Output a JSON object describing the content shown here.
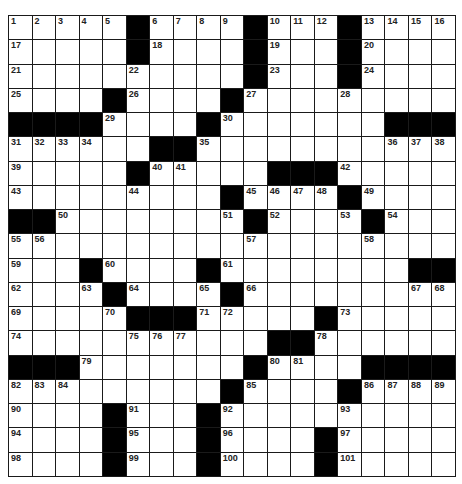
{
  "puzzle": {
    "rows": 19,
    "cols": 19,
    "colors": {
      "block": "#000000",
      "cell": "#ffffff",
      "line": "#1a1a1a",
      "number": "#222222"
    },
    "grid": [
      "WWWWWBWWWWBWWWBWWWW",
      "WWWWWBWWWWBWWWBWWWW",
      "WWWWWWWWWWBWWWBWWWW",
      "WWWWBWWWWBWWWWWWWWW",
      "BBBBWWWWBWWWWWWWBBB",
      "WWWWWWBBWWWWWWWWWWW",
      "WWWWWBWWWWWBBBWWWWW",
      "WWWWWWWWWBWWWWBWWWW",
      "BBWWWWWWWWBWWWWBWWW",
      "WWWWWWWWWWWWWWWWWWW",
      "WWWBWWWWBWWWWWWWWBB",
      "WWWWBWWWWBWWWWWWWWW",
      "WWWWWBBBWWWWWBWWWWW",
      "WWWWWWWWWWWBBWWWWWW",
      "BBBWWWWWWWBWWWWBBBB",
      "WWWWWWWWWBWWWWBWWWW",
      "WWWWBWWWBWWWWWWWWWW",
      "WWWWBWWWBWWWWBWWWWW",
      "WWWWBWWWBWWWWBWWWWW"
    ],
    "numbers": [
      {
        "r": 0,
        "c": 0,
        "n": "1"
      },
      {
        "r": 0,
        "c": 1,
        "n": "2"
      },
      {
        "r": 0,
        "c": 2,
        "n": "3"
      },
      {
        "r": 0,
        "c": 3,
        "n": "4"
      },
      {
        "r": 0,
        "c": 4,
        "n": "5"
      },
      {
        "r": 0,
        "c": 6,
        "n": "6"
      },
      {
        "r": 0,
        "c": 7,
        "n": "7"
      },
      {
        "r": 0,
        "c": 8,
        "n": "8"
      },
      {
        "r": 0,
        "c": 9,
        "n": "9"
      },
      {
        "r": 0,
        "c": 11,
        "n": "10"
      },
      {
        "r": 0,
        "c": 12,
        "n": "11"
      },
      {
        "r": 0,
        "c": 13,
        "n": "12"
      },
      {
        "r": 0,
        "c": 15,
        "n": "13"
      },
      {
        "r": 0,
        "c": 16,
        "n": "14"
      },
      {
        "r": 0,
        "c": 17,
        "n": "15"
      },
      {
        "r": 0,
        "c": 18,
        "n": "16"
      },
      {
        "r": 1,
        "c": 0,
        "n": "17"
      },
      {
        "r": 1,
        "c": 6,
        "n": "18"
      },
      {
        "r": 1,
        "c": 11,
        "n": "19"
      },
      {
        "r": 1,
        "c": 15,
        "n": "20"
      },
      {
        "r": 2,
        "c": 0,
        "n": "21"
      },
      {
        "r": 2,
        "c": 5,
        "n": "22"
      },
      {
        "r": 2,
        "c": 11,
        "n": "23"
      },
      {
        "r": 2,
        "c": 15,
        "n": "24"
      },
      {
        "r": 3,
        "c": 0,
        "n": "25"
      },
      {
        "r": 3,
        "c": 5,
        "n": "26"
      },
      {
        "r": 3,
        "c": 10,
        "n": "27"
      },
      {
        "r": 3,
        "c": 14,
        "n": "28"
      },
      {
        "r": 4,
        "c": 4,
        "n": "29"
      },
      {
        "r": 4,
        "c": 9,
        "n": "30"
      },
      {
        "r": 5,
        "c": 0,
        "n": "31"
      },
      {
        "r": 5,
        "c": 1,
        "n": "32"
      },
      {
        "r": 5,
        "c": 2,
        "n": "33"
      },
      {
        "r": 5,
        "c": 3,
        "n": "34"
      },
      {
        "r": 5,
        "c": 8,
        "n": "35"
      },
      {
        "r": 5,
        "c": 16,
        "n": "36"
      },
      {
        "r": 5,
        "c": 17,
        "n": "37"
      },
      {
        "r": 5,
        "c": 18,
        "n": "38"
      },
      {
        "r": 6,
        "c": 0,
        "n": "39"
      },
      {
        "r": 6,
        "c": 6,
        "n": "40"
      },
      {
        "r": 6,
        "c": 7,
        "n": "41"
      },
      {
        "r": 6,
        "c": 14,
        "n": "42"
      },
      {
        "r": 7,
        "c": 0,
        "n": "43"
      },
      {
        "r": 7,
        "c": 5,
        "n": "44"
      },
      {
        "r": 7,
        "c": 10,
        "n": "45"
      },
      {
        "r": 7,
        "c": 11,
        "n": "46"
      },
      {
        "r": 7,
        "c": 12,
        "n": "47"
      },
      {
        "r": 7,
        "c": 13,
        "n": "48"
      },
      {
        "r": 7,
        "c": 15,
        "n": "49"
      },
      {
        "r": 8,
        "c": 2,
        "n": "50"
      },
      {
        "r": 8,
        "c": 9,
        "n": "51"
      },
      {
        "r": 8,
        "c": 11,
        "n": "52"
      },
      {
        "r": 8,
        "c": 14,
        "n": "53"
      },
      {
        "r": 8,
        "c": 16,
        "n": "54"
      },
      {
        "r": 9,
        "c": 0,
        "n": "55"
      },
      {
        "r": 9,
        "c": 1,
        "n": "56"
      },
      {
        "r": 9,
        "c": 10,
        "n": "57"
      },
      {
        "r": 9,
        "c": 15,
        "n": "58"
      },
      {
        "r": 10,
        "c": 0,
        "n": "59"
      },
      {
        "r": 10,
        "c": 4,
        "n": "60"
      },
      {
        "r": 10,
        "c": 9,
        "n": "61"
      },
      {
        "r": 11,
        "c": 0,
        "n": "62"
      },
      {
        "r": 11,
        "c": 3,
        "n": "63"
      },
      {
        "r": 11,
        "c": 5,
        "n": "64"
      },
      {
        "r": 11,
        "c": 8,
        "n": "65"
      },
      {
        "r": 11,
        "c": 10,
        "n": "66"
      },
      {
        "r": 11,
        "c": 17,
        "n": "67"
      },
      {
        "r": 11,
        "c": 18,
        "n": "68"
      },
      {
        "r": 12,
        "c": 0,
        "n": "69"
      },
      {
        "r": 12,
        "c": 4,
        "n": "70"
      },
      {
        "r": 12,
        "c": 8,
        "n": "71"
      },
      {
        "r": 12,
        "c": 9,
        "n": "72"
      },
      {
        "r": 12,
        "c": 14,
        "n": "73"
      },
      {
        "r": 13,
        "c": 0,
        "n": "74"
      },
      {
        "r": 13,
        "c": 5,
        "n": "75"
      },
      {
        "r": 13,
        "c": 6,
        "n": "76"
      },
      {
        "r": 13,
        "c": 7,
        "n": "77"
      },
      {
        "r": 13,
        "c": 13,
        "n": "78"
      },
      {
        "r": 14,
        "c": 3,
        "n": "79"
      },
      {
        "r": 14,
        "c": 11,
        "n": "80"
      },
      {
        "r": 14,
        "c": 12,
        "n": "81"
      },
      {
        "r": 15,
        "c": 0,
        "n": "82"
      },
      {
        "r": 15,
        "c": 1,
        "n": "83"
      },
      {
        "r": 15,
        "c": 2,
        "n": "84"
      },
      {
        "r": 15,
        "c": 10,
        "n": "85"
      },
      {
        "r": 15,
        "c": 15,
        "n": "86"
      },
      {
        "r": 15,
        "c": 16,
        "n": "87"
      },
      {
        "r": 15,
        "c": 17,
        "n": "88"
      },
      {
        "r": 15,
        "c": 18,
        "n": "89"
      },
      {
        "r": 16,
        "c": 0,
        "n": "90"
      },
      {
        "r": 16,
        "c": 5,
        "n": "91"
      },
      {
        "r": 16,
        "c": 9,
        "n": "92"
      },
      {
        "r": 16,
        "c": 14,
        "n": "93"
      },
      {
        "r": 17,
        "c": 0,
        "n": "94"
      },
      {
        "r": 17,
        "c": 5,
        "n": "95"
      },
      {
        "r": 17,
        "c": 9,
        "n": "96"
      },
      {
        "r": 17,
        "c": 14,
        "n": "97"
      },
      {
        "r": 18,
        "c": 0,
        "n": "98"
      },
      {
        "r": 18,
        "c": 5,
        "n": "99"
      },
      {
        "r": 18,
        "c": 9,
        "n": "100"
      },
      {
        "r": 18,
        "c": 14,
        "n": "101"
      }
    ]
  }
}
